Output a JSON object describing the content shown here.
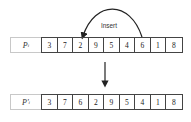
{
  "annotation": {
    "insert_label": "Insert"
  },
  "rows": [
    {
      "label": "P",
      "label_subscript": "i",
      "values": [
        "3",
        "7",
        "2",
        "9",
        "5",
        "4",
        "6",
        "1",
        "8"
      ]
    },
    {
      "label": "P'",
      "label_subscript": "i",
      "values": [
        "3",
        "7",
        "6",
        "2",
        "9",
        "5",
        "4",
        "1",
        "8"
      ]
    }
  ],
  "operation": {
    "type": "insertion-mutation",
    "moved_value": "6",
    "from_position": 7,
    "to_position": 3
  },
  "colors": {
    "border": "#444444",
    "label_border": "#c8c8c8",
    "arrow": "#222222"
  }
}
